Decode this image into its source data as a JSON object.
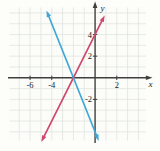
{
  "chart_data": {
    "type": "line",
    "title": "",
    "xlabel": "x",
    "ylabel": "y",
    "xlim": [
      -7.9,
      4.7
    ],
    "ylim": [
      -5.8,
      6.5
    ],
    "grid": true,
    "grid_step": 1,
    "x_tick_labels": [
      {
        "value": -6,
        "label": "-6"
      },
      {
        "value": -4,
        "label": "-4"
      },
      {
        "value": 2,
        "label": "2"
      }
    ],
    "y_tick_labels": [
      {
        "value": 4,
        "label": "4"
      },
      {
        "value": 2,
        "label": "2"
      },
      {
        "value": -2,
        "label": "-2"
      }
    ],
    "series": [
      {
        "name": "pink-rising-line",
        "slope": 2,
        "y_intercept": 4,
        "x_intercept": -2,
        "color": "#d0486e",
        "x_start": -4.8,
        "x_end": 0.72,
        "arrowheads": true
      },
      {
        "name": "blue-falling-line",
        "slope": -2.5,
        "y_intercept": -5,
        "x_intercept": -2,
        "color": "#3fa8d8",
        "x_start": -4.35,
        "x_end": 0.2,
        "arrowheads": true
      }
    ],
    "intersection": [
      -2,
      0
    ],
    "legend": null
  },
  "colors": {
    "background": "#fdfdfa",
    "plot_background": "#fcfcf8",
    "gridline": "#dce3df",
    "axis": "#3f3f3f",
    "tick_text": "#1c1c1c"
  }
}
